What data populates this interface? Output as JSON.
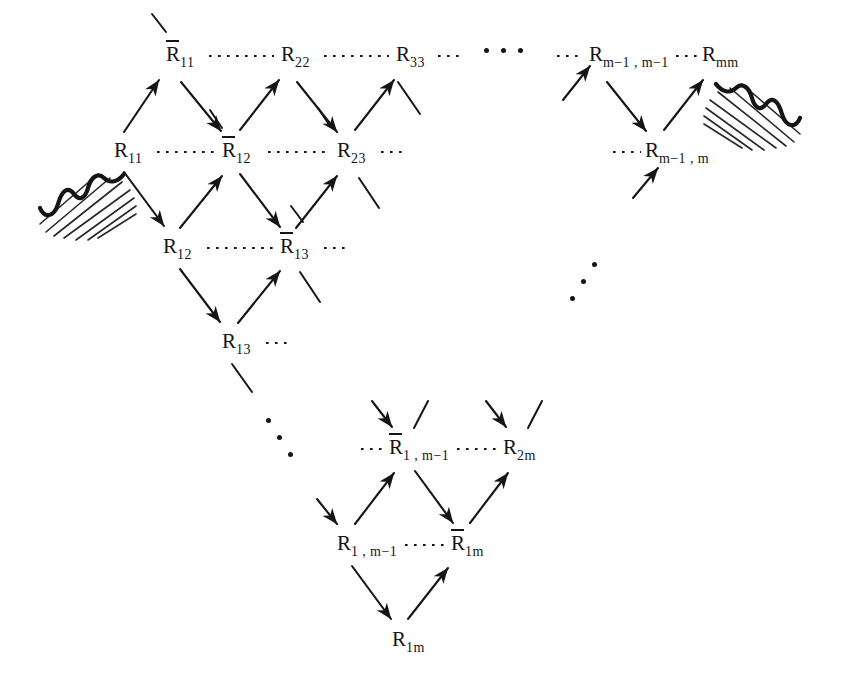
{
  "figure": {
    "ink_color": "#151515",
    "background": "#ffffff",
    "notation": {
      "overbar_meaning": "barred R",
      "plain_meaning": "unbarred R"
    }
  },
  "nodes": [
    {
      "id": "Rb11",
      "bar": true,
      "base": "R",
      "sub": "11",
      "x": 166,
      "y": 44,
      "name": "node-rbar-11"
    },
    {
      "id": "R22",
      "bar": false,
      "base": "R",
      "sub": "22",
      "x": 281,
      "y": 44,
      "name": "node-r-22"
    },
    {
      "id": "R33",
      "bar": false,
      "base": "R",
      "sub": "33",
      "x": 396,
      "y": 44,
      "name": "node-r-33"
    },
    {
      "id": "Rm1m1",
      "bar": false,
      "base": "R",
      "sub": "m−1 , m−1",
      "x": 589,
      "y": 44,
      "name": "node-r-m1-m1"
    },
    {
      "id": "Rmm",
      "bar": false,
      "base": "R",
      "sub": "mm",
      "x": 702,
      "y": 44,
      "name": "node-r-mm"
    },
    {
      "id": "R11",
      "bar": false,
      "base": "R",
      "sub": "11",
      "x": 114,
      "y": 140,
      "name": "node-r-11"
    },
    {
      "id": "Rb12",
      "bar": true,
      "base": "R",
      "sub": "12",
      "x": 222,
      "y": 140,
      "name": "node-rbar-12"
    },
    {
      "id": "R23",
      "bar": false,
      "base": "R",
      "sub": "23",
      "x": 337,
      "y": 140,
      "name": "node-r-23"
    },
    {
      "id": "Rm1m",
      "bar": false,
      "base": "R",
      "sub": "m−1 , m",
      "x": 645,
      "y": 140,
      "name": "node-r-m1-m"
    },
    {
      "id": "R12",
      "bar": false,
      "base": "R",
      "sub": "12",
      "x": 163,
      "y": 236,
      "name": "node-r-12"
    },
    {
      "id": "Rb13",
      "bar": true,
      "base": "R",
      "sub": "13",
      "x": 280,
      "y": 236,
      "name": "node-rbar-13"
    },
    {
      "id": "R13",
      "bar": false,
      "base": "R",
      "sub": "13",
      "x": 222,
      "y": 331,
      "name": "node-r-13"
    },
    {
      "id": "Rb1m1",
      "bar": true,
      "base": "R",
      "sub": "1 , m−1",
      "x": 389,
      "y": 437,
      "name": "node-rbar-1-m1"
    },
    {
      "id": "R2m",
      "bar": false,
      "base": "R",
      "sub": "2m",
      "x": 503,
      "y": 437,
      "name": "node-r-2m"
    },
    {
      "id": "R1m1",
      "bar": false,
      "base": "R",
      "sub": "1 , m−1",
      "x": 337,
      "y": 533,
      "name": "node-r-1-m1"
    },
    {
      "id": "Rb1m",
      "bar": true,
      "base": "R",
      "sub": "1m",
      "x": 451,
      "y": 533,
      "name": "node-rbar-1m"
    },
    {
      "id": "R1m",
      "bar": false,
      "base": "R",
      "sub": "1m",
      "x": 392,
      "y": 629,
      "name": "node-r-1m"
    }
  ],
  "dotted_links": [
    {
      "from": "R11",
      "to": "Rb12",
      "x1": 157,
      "y1": 152,
      "x2": 215,
      "y2": 152,
      "name": "dotted-link-r11-rbar12"
    },
    {
      "from": "Rb12",
      "to": "R23",
      "x1": 268,
      "y1": 152,
      "x2": 331,
      "y2": 152,
      "name": "dotted-link-rbar12-r23"
    },
    {
      "from": "R23",
      "to": "right",
      "x1": 381,
      "y1": 152,
      "x2": 404,
      "y2": 152,
      "name": "dotted-link-r23-right"
    },
    {
      "from": "Rb11",
      "to": "R22",
      "x1": 209,
      "y1": 56,
      "x2": 274,
      "y2": 56,
      "name": "dotted-link-rbar11-r22"
    },
    {
      "from": "R22",
      "to": "R33",
      "x1": 324,
      "y1": 56,
      "x2": 389,
      "y2": 56,
      "name": "dotted-link-r22-r33"
    },
    {
      "from": "R33",
      "to": "right",
      "x1": 438,
      "y1": 56,
      "x2": 462,
      "y2": 56,
      "name": "dotted-link-r33-right"
    },
    {
      "from": "left",
      "to": "Rm1m1",
      "x1": 557,
      "y1": 56,
      "x2": 584,
      "y2": 56,
      "name": "dotted-link-left-rm1m1"
    },
    {
      "from": "Rm1m1",
      "to": "Rmm",
      "x1": 676,
      "y1": 56,
      "x2": 697,
      "y2": 56,
      "name": "dotted-link-rm1m1-rmm"
    },
    {
      "from": "left",
      "to": "Rm1m",
      "x1": 613,
      "y1": 152,
      "x2": 641,
      "y2": 152,
      "name": "dotted-link-left-rm1m"
    },
    {
      "from": "R12",
      "to": "Rb13",
      "x1": 207,
      "y1": 248,
      "x2": 274,
      "y2": 248,
      "name": "dotted-link-r12-rbar13"
    },
    {
      "from": "Rb13",
      "to": "right",
      "x1": 324,
      "y1": 248,
      "x2": 347,
      "y2": 248,
      "name": "dotted-link-rbar13-right"
    },
    {
      "from": "left",
      "to": "Rb13",
      "x1": 252,
      "y1": 248,
      "x2": 268,
      "y2": 248,
      "name": "dotted-link-left-rbar13"
    },
    {
      "from": "R13",
      "to": "right",
      "x1": 266,
      "y1": 343,
      "x2": 290,
      "y2": 343,
      "name": "dotted-link-r13-right"
    },
    {
      "from": "left",
      "to": "Rb1m1",
      "x1": 361,
      "y1": 449,
      "x2": 384,
      "y2": 449,
      "name": "dotted-link-left-rbar1m1"
    },
    {
      "from": "Rb1m1",
      "to": "R2m",
      "x1": 457,
      "y1": 449,
      "x2": 498,
      "y2": 449,
      "name": "dotted-link-rbar1m1-r2m"
    },
    {
      "from": "R1m1",
      "to": "Rb1m",
      "x1": 405,
      "y1": 545,
      "x2": 446,
      "y2": 545,
      "name": "dotted-link-r1m1-rbar1m"
    }
  ],
  "arrows": [
    {
      "from": "R11",
      "to": "Rb11",
      "x1": 124,
      "y1": 132,
      "x2": 159,
      "y2": 80,
      "name": "arrow-r11-to-rbar11"
    },
    {
      "from": "Rb11",
      "to": "Rb12",
      "x1": 181,
      "y1": 82,
      "x2": 221,
      "y2": 131,
      "name": "arrow-rbar11-to-rbar12"
    },
    {
      "from": "R11",
      "to": "R12",
      "x1": 124,
      "y1": 172,
      "x2": 164,
      "y2": 226,
      "name": "arrow-r11-to-r12"
    },
    {
      "from": "R12",
      "to": "Rb12",
      "x1": 180,
      "y1": 228,
      "x2": 222,
      "y2": 176,
      "name": "arrow-r12-to-rbar12"
    },
    {
      "from": "Rb12",
      "to": "R22",
      "x1": 240,
      "y1": 130,
      "x2": 279,
      "y2": 80,
      "name": "arrow-rbar12-to-r22"
    },
    {
      "from": "R22",
      "to": "R23",
      "x1": 297,
      "y1": 82,
      "x2": 337,
      "y2": 132,
      "name": "arrow-r22-to-r23"
    },
    {
      "from": "Rb12",
      "to": "Rb13",
      "x1": 240,
      "y1": 174,
      "x2": 280,
      "y2": 227,
      "name": "arrow-rbar12-to-rbar13"
    },
    {
      "from": "Rb13",
      "to": "R23",
      "x1": 296,
      "y1": 228,
      "x2": 337,
      "y2": 176,
      "name": "arrow-rbar13-to-r23"
    },
    {
      "from": "R23",
      "to": "R33",
      "x1": 355,
      "y1": 130,
      "x2": 394,
      "y2": 80,
      "name": "arrow-r23-to-r33"
    },
    {
      "from": "R12",
      "to": "R13",
      "x1": 180,
      "y1": 269,
      "x2": 220,
      "y2": 322,
      "name": "arrow-r12-to-r13"
    },
    {
      "from": "R13",
      "to": "Rb13",
      "x1": 238,
      "y1": 323,
      "x2": 280,
      "y2": 271,
      "name": "arrow-r13-to-rbar13"
    },
    {
      "from": "stub",
      "to": "Rm1m1",
      "x1": 563,
      "y1": 100,
      "x2": 590,
      "y2": 66,
      "name": "arrow-stub-to-rm1m1"
    },
    {
      "from": "Rm1m1",
      "to": "Rm1m",
      "x1": 607,
      "y1": 82,
      "x2": 646,
      "y2": 131,
      "name": "arrow-rm1m1-to-rm1m"
    },
    {
      "from": "Rm1m",
      "to": "Rmm",
      "x1": 664,
      "y1": 130,
      "x2": 703,
      "y2": 80,
      "name": "arrow-rm1m-to-rmm"
    },
    {
      "from": "stub",
      "to": "Rm1m",
      "x1": 633,
      "y1": 198,
      "x2": 658,
      "y2": 168,
      "name": "arrow-stub-to-rm1m"
    },
    {
      "from": "stub",
      "to": "Rb1m1",
      "x1": 372,
      "y1": 401,
      "x2": 392,
      "y2": 427,
      "name": "arrow-stub-to-rbar1m1"
    },
    {
      "from": "stub",
      "to": "R2m",
      "x1": 486,
      "y1": 401,
      "x2": 506,
      "y2": 427,
      "name": "arrow-stub-to-r2m"
    },
    {
      "from": "stub",
      "to": "R1m1",
      "x1": 317,
      "y1": 499,
      "x2": 337,
      "y2": 524,
      "name": "arrow-stub-to-r1m1"
    },
    {
      "from": "R1m1",
      "to": "Rb1m1",
      "x1": 355,
      "y1": 524,
      "x2": 394,
      "y2": 473,
      "name": "arrow-r1m1-to-rbar1m1"
    },
    {
      "from": "Rb1m1",
      "to": "Rb1m",
      "x1": 415,
      "y1": 471,
      "x2": 453,
      "y2": 523,
      "name": "arrow-rbar1m1-to-rbar1m"
    },
    {
      "from": "Rb1m",
      "to": "R2m",
      "x1": 470,
      "y1": 523,
      "x2": 508,
      "y2": 473,
      "name": "arrow-rbar1m-to-r2m"
    },
    {
      "from": "R1m1",
      "to": "R1m",
      "x1": 352,
      "y1": 566,
      "x2": 391,
      "y2": 619,
      "name": "arrow-r1m1-to-r1m"
    },
    {
      "from": "R1m",
      "to": "Rb1m",
      "x1": 408,
      "y1": 619,
      "x2": 448,
      "y2": 568,
      "name": "arrow-r1m-to-rbar1m"
    }
  ],
  "stub_lines": [
    {
      "at": "Rb11",
      "x1": 166,
      "y1": 32,
      "x2": 152,
      "y2": 14,
      "name": "stub-above-rbar11"
    },
    {
      "at": "R33",
      "x1": 398,
      "y1": 82,
      "x2": 420,
      "y2": 114,
      "name": "stub-below-r33"
    },
    {
      "at": "R23",
      "x1": 359,
      "y1": 178,
      "x2": 379,
      "y2": 208,
      "name": "stub-below-r23"
    },
    {
      "at": "Rb13",
      "x1": 300,
      "y1": 272,
      "x2": 320,
      "y2": 302,
      "name": "stub-below-rbar13"
    },
    {
      "at": "R13",
      "x1": 232,
      "y1": 364,
      "x2": 252,
      "y2": 392,
      "name": "stub-below-r13"
    },
    {
      "at": "Rb12",
      "x1": 222,
      "y1": 128,
      "x2": 210,
      "y2": 110,
      "name": "stub-above-rbar12"
    },
    {
      "at": "Rb1m1",
      "x1": 414,
      "y1": 428,
      "x2": 428,
      "y2": 401,
      "name": "stub-above-rbar1m1"
    },
    {
      "at": "R2m",
      "x1": 528,
      "y1": 428,
      "x2": 542,
      "y2": 401,
      "name": "stub-above-r2m"
    },
    {
      "at": "R23t",
      "x1": 330,
      "y1": 126,
      "x2": 318,
      "y2": 108,
      "name": "stub-above-r23"
    },
    {
      "at": "Rb13t",
      "x1": 303,
      "y1": 222,
      "x2": 291,
      "y2": 206,
      "name": "stub-above-rbar13"
    }
  ],
  "ellipses": [
    {
      "kind": "horizontal",
      "glyph": "⋯",
      "x": 484,
      "y": 48,
      "name": "ellipsis-horizontal-top"
    },
    {
      "kind": "diagonal-up",
      "glyph": "⋰",
      "x": 570,
      "y": 262,
      "name": "ellipsis-diagonal-right"
    },
    {
      "kind": "diagonal-down",
      "glyph": "⋱",
      "x": 266,
      "y": 418,
      "name": "ellipsis-diagonal-left"
    }
  ],
  "decorations": [
    {
      "id": "left-hatch",
      "label": "torn-edge-hatching-left",
      "x": 38,
      "y": 152,
      "name": "decoration-hatch-left"
    },
    {
      "id": "right-hatch",
      "label": "torn-edge-hatching-right",
      "x": 706,
      "y": 62,
      "name": "decoration-hatch-right"
    }
  ]
}
